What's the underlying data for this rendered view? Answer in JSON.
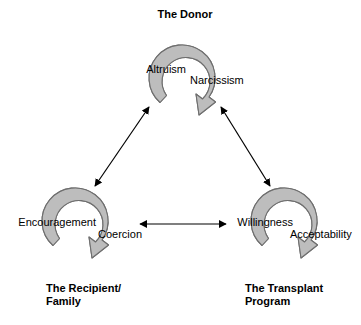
{
  "diagram": {
    "type": "cycle-triad-diagram",
    "background_color": "#ffffff",
    "ring_fill_color": "#bdbdbd",
    "ring_stroke_color": "#6e6e6e",
    "connector_color": "#000000",
    "clusters": [
      {
        "id": "donor",
        "title": "The Donor",
        "title_position": "top",
        "left_label": "Altruism",
        "right_label": "Narcissism"
      },
      {
        "id": "recipient",
        "title": "The Recipient/\nFamily",
        "title_position": "bottom",
        "left_label": "Encouragement",
        "right_label": "Coercion"
      },
      {
        "id": "transplant",
        "title": "The Transplant\nProgram",
        "title_position": "bottom",
        "left_label": "Willingness",
        "right_label": "Acceptability"
      }
    ],
    "connectors": [
      {
        "id": "donor-recipient",
        "from": "Altruism",
        "to": "Encouragement",
        "style": "double-headed"
      },
      {
        "id": "donor-transplant",
        "from": "Narcissism",
        "to": "Acceptability",
        "style": "double-headed"
      },
      {
        "id": "recipient-transplant",
        "from": "Coercion",
        "to": "Willingness",
        "style": "double-headed"
      }
    ]
  }
}
